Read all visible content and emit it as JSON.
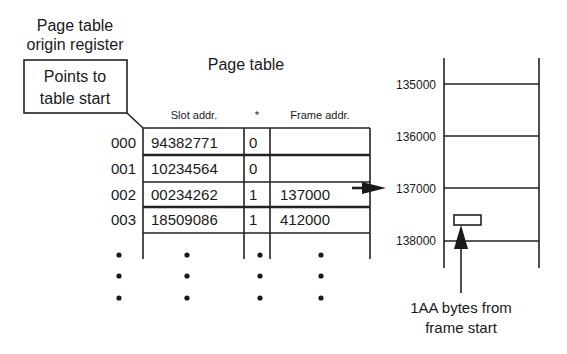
{
  "register": {
    "title_line1": "Page table",
    "title_line2": "origin register",
    "box_line1": "Points to",
    "box_line2": "table start"
  },
  "page_table": {
    "title": "Page table",
    "columns": [
      "Slot addr.",
      "*",
      "Frame addr."
    ],
    "rows": [
      {
        "index": "000",
        "slot": "94382771",
        "flag": "0",
        "frame": ""
      },
      {
        "index": "001",
        "slot": "10234564",
        "flag": "0",
        "frame": ""
      },
      {
        "index": "002",
        "slot": "00234262",
        "flag": "1",
        "frame": "137000"
      },
      {
        "index": "003",
        "slot": "18509086",
        "flag": "1",
        "frame": "412000"
      }
    ],
    "ellipsis": "•"
  },
  "memory": {
    "addresses": [
      "135000",
      "136000",
      "137000",
      "138000"
    ],
    "offset_label_line1": "1AA bytes from",
    "offset_label_line2": "frame start"
  }
}
